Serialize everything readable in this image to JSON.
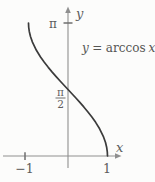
{
  "colors": {
    "background": "#fcfcfb",
    "axis": "#8f8f8f",
    "tick": "#6e6e6e",
    "text": "#5d5d5d",
    "curve": "#3b3b3b"
  },
  "chart_data": {
    "type": "line",
    "xlabel": "x",
    "ylabel": "y",
    "xlim": [
      -1.65,
      1.35
    ],
    "ylim": [
      -0.62,
      3.55
    ],
    "grid": false,
    "legend": false,
    "x_ticks": [
      {
        "value": -1,
        "label": "−1"
      },
      {
        "value": 1,
        "label": "1"
      }
    ],
    "y_ticks": [
      {
        "value": 1.5708,
        "label": "π/2",
        "label_numerator": "π",
        "label_denominator": "2",
        "style": "fraction"
      },
      {
        "value": 3.1416,
        "label": "π"
      }
    ],
    "annotation": {
      "lhs": "y",
      "rel": "=",
      "func": "arccos",
      "var": "x"
    },
    "series": [
      {
        "name": "y = arccos x",
        "color": "#3b3b3b",
        "x": [
          -1,
          -0.995,
          -0.98,
          -0.95,
          -0.9,
          -0.8,
          -0.7,
          -0.6,
          -0.5,
          -0.4,
          -0.3,
          -0.2,
          -0.1,
          0,
          0.1,
          0.2,
          0.3,
          0.4,
          0.5,
          0.6,
          0.7,
          0.8,
          0.9,
          0.95,
          0.98,
          0.995,
          1
        ],
        "y": [
          3.1416,
          3.0416,
          2.9413,
          2.824,
          2.6906,
          2.4981,
          2.3462,
          2.2143,
          2.0944,
          1.9823,
          1.8755,
          1.7722,
          1.671,
          1.5708,
          1.4706,
          1.3694,
          1.2661,
          1.1593,
          1.0472,
          0.9273,
          0.7954,
          0.6435,
          0.451,
          0.3176,
          0.2003,
          0.1,
          0
        ]
      }
    ]
  }
}
